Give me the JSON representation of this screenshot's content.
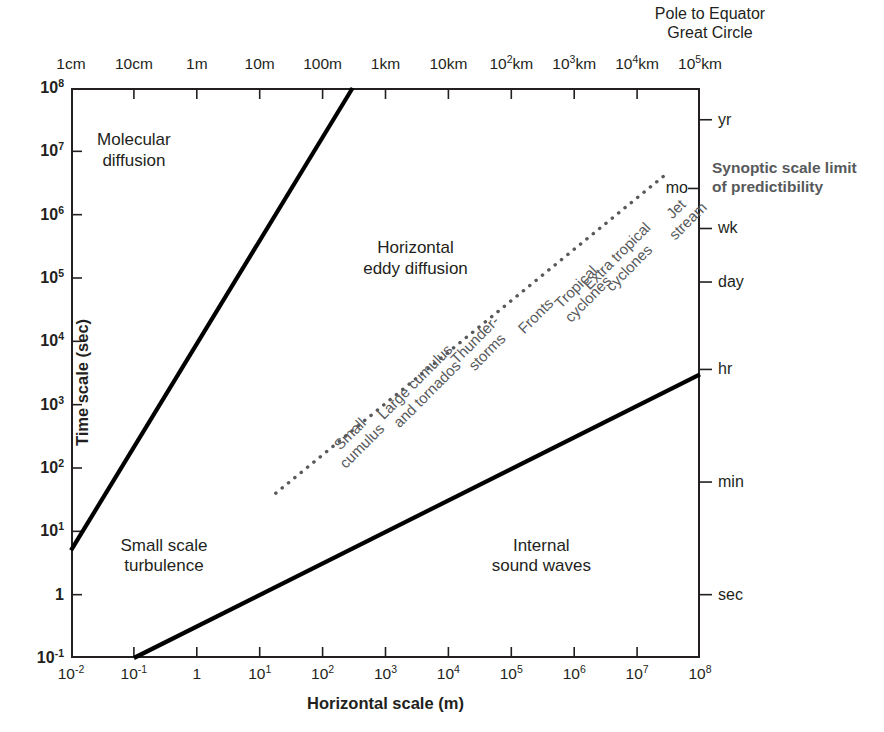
{
  "figure": {
    "headline": [
      "Pole to Equator",
      "Great Circle"
    ],
    "xlabel": "Horizontal scale (m)",
    "ylabel": "Time scale (sec)",
    "synoptic_note": [
      "Synoptic scale limit",
      "of predictibility"
    ],
    "accent_gray": "#58595b",
    "ink": "#231f20"
  },
  "chart_data": {
    "type": "scatter",
    "title": "",
    "subtitle": "Pole to Equator Great Circle",
    "xlabel": "Horizontal scale (m)",
    "ylabel": "Time scale (sec)",
    "xscale": "log",
    "yscale": "log",
    "xlim": [
      0.01,
      100000000
    ],
    "ylim": [
      0.1,
      100000000
    ],
    "grid": false,
    "legend": "none",
    "x_tick_labels": [
      "10⁻²",
      "10⁻¹",
      "1",
      "10¹",
      "10²",
      "10³",
      "10⁴",
      "10⁵",
      "10⁶",
      "10⁷",
      "10⁸"
    ],
    "x_tick_values": [
      0.01,
      0.1,
      1,
      10,
      100,
      1000,
      10000,
      100000,
      1000000,
      10000000,
      100000000
    ],
    "x_top_tick_labels": [
      "1cm",
      "10cm",
      "1m",
      "10m",
      "100m",
      "1km",
      "10km",
      "10²km",
      "10³km",
      "10⁴km",
      "10⁵km"
    ],
    "y_tick_labels": [
      "10⁸",
      "10⁷",
      "10⁶",
      "10⁵",
      "10⁴",
      "10³",
      "10²",
      "10¹",
      "1",
      "10⁻¹"
    ],
    "y_tick_values": [
      100000000,
      10000000,
      1000000,
      100000,
      10000,
      1000,
      100,
      10,
      1,
      0.1
    ],
    "y_right_labels": [
      {
        "label": "yr",
        "y_sec": 31536000
      },
      {
        "label": "mo",
        "y_sec": 2592000
      },
      {
        "label": "wk",
        "y_sec": 604800
      },
      {
        "label": "day",
        "y_sec": 86400
      },
      {
        "label": "hr",
        "y_sec": 3600
      },
      {
        "label": "min",
        "y_sec": 60
      },
      {
        "label": "sec",
        "y_sec": 1
      }
    ],
    "regions": [
      {
        "name": "Molecular diffusion",
        "lines": [
          "Molecular",
          "diffusion"
        ],
        "x": 0.1,
        "y": 10000000
      },
      {
        "name": "Horizontal eddy diffusion",
        "lines": [
          "Horizontal",
          "eddy diffusion"
        ],
        "x": 3000,
        "y": 200000
      },
      {
        "name": "Small scale turbulence",
        "lines": [
          "Small scale",
          "turbulence"
        ],
        "x": 0.3,
        "y": 4
      },
      {
        "name": "Internal sound waves",
        "lines": [
          "Internal",
          "sound waves"
        ],
        "x": 300000,
        "y": 4
      }
    ],
    "boundary_lines": [
      {
        "name": "molecular-diffusion-boundary",
        "style": "solid",
        "points": [
          [
            0.01,
            5
          ],
          [
            300,
            100000000
          ]
        ]
      },
      {
        "name": "internal-sound-waves-boundary",
        "style": "solid",
        "points": [
          [
            0.1,
            0.1
          ],
          [
            100000000,
            3000
          ]
        ]
      },
      {
        "name": "phenomena-scale-trendline",
        "style": "dotted",
        "points": [
          [
            18,
            40
          ],
          [
            30000000,
            4500000
          ]
        ]
      }
    ],
    "phenomena_labels": [
      {
        "label": [
          "Small",
          "cumulus"
        ],
        "x": 120,
        "y": 700
      },
      {
        "label": [
          "Large cumulus",
          "and tornados"
        ],
        "x": 1500,
        "y": 5000
      },
      {
        "label": [
          "Thunder-",
          "storms"
        ],
        "x": 15000,
        "y": 22000
      },
      {
        "label": [
          "Fronts"
        ],
        "x": 120000,
        "y": 60000
      },
      {
        "label": [
          "Tropical",
          "cyclones"
        ],
        "x": 600000,
        "y": 150000
      },
      {
        "label": [
          "Extra tropical",
          "cyclones"
        ],
        "x": 2500000,
        "y": 500000
      },
      {
        "label": [
          "Jet",
          "stream"
        ],
        "x": 20000000,
        "y": 2500000
      }
    ],
    "annotations": [
      {
        "text": "Synoptic scale limit of predictibility",
        "placement": "right of plot near 10^6 s"
      },
      {
        "text": "Pole to Equator Great Circle",
        "placement": "above top axis at 10^5 km"
      }
    ]
  },
  "axes": {
    "top_ticks": [
      {
        "label_html": "1cm"
      },
      {
        "label_html": "10cm"
      },
      {
        "label_html": "1m"
      },
      {
        "label_html": "10m"
      },
      {
        "label_html": "100m"
      },
      {
        "label_html": "1km"
      },
      {
        "label_html": "10km"
      },
      {
        "label_html": "10<sup>2</sup>km"
      },
      {
        "label_html": "10<sup>3</sup>km"
      },
      {
        "label_html": "10<sup>4</sup>km"
      },
      {
        "label_html": "10<sup>5</sup>km"
      }
    ],
    "bottom_ticks": [
      {
        "label_html": "10<sup>-2</sup>"
      },
      {
        "label_html": "10<sup>-1</sup>"
      },
      {
        "label_html": "1"
      },
      {
        "label_html": "10<sup>1</sup>"
      },
      {
        "label_html": "10<sup>2</sup>"
      },
      {
        "label_html": "10<sup>3</sup>"
      },
      {
        "label_html": "10<sup>4</sup>"
      },
      {
        "label_html": "10<sup>5</sup>"
      },
      {
        "label_html": "10<sup>6</sup>"
      },
      {
        "label_html": "10<sup>7</sup>"
      },
      {
        "label_html": "10<sup>8</sup>"
      }
    ],
    "left_ticks": [
      {
        "label_html": "10<sup>8</sup>"
      },
      {
        "label_html": "10<sup>7</sup>"
      },
      {
        "label_html": "10<sup>6</sup>"
      },
      {
        "label_html": "10<sup>5</sup>"
      },
      {
        "label_html": "10<sup>4</sup>"
      },
      {
        "label_html": "10<sup>3</sup>"
      },
      {
        "label_html": "10<sup>2</sup>"
      },
      {
        "label_html": "10<sup>1</sup>"
      },
      {
        "label_html": "1"
      },
      {
        "label_html": "10<sup>-1</sup>"
      }
    ],
    "right_ticks": [
      {
        "label_html": "yr"
      },
      {
        "label_html": "mo"
      },
      {
        "label_html": "wk"
      },
      {
        "label_html": "day"
      },
      {
        "label_html": "hr"
      },
      {
        "label_html": "min"
      },
      {
        "label_html": "sec"
      }
    ]
  }
}
